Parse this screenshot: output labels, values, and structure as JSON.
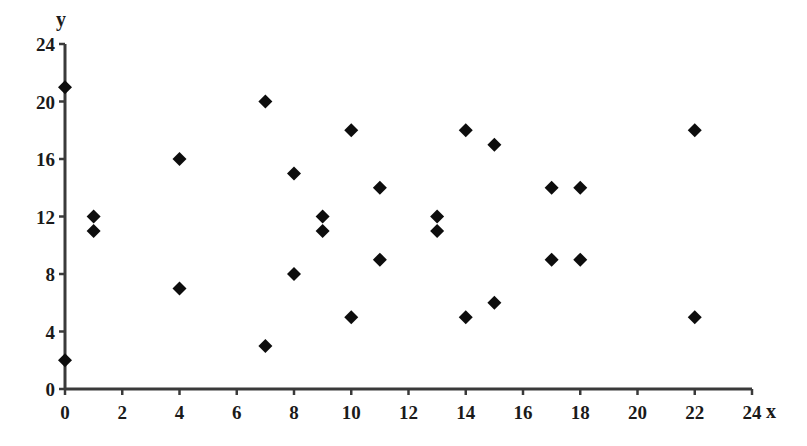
{
  "chart_data": {
    "type": "scatter",
    "title": "",
    "xlabel": "x",
    "ylabel": "y",
    "xlim": [
      0,
      24
    ],
    "ylim": [
      0,
      24
    ],
    "x_ticks": [
      0,
      2,
      4,
      6,
      8,
      10,
      12,
      14,
      16,
      18,
      20,
      22,
      24
    ],
    "y_ticks": [
      0,
      4,
      8,
      12,
      16,
      20,
      24
    ],
    "grid": false,
    "legend": null,
    "marker": "diamond",
    "marker_color": "#0d0d0d",
    "series": [
      {
        "name": "points",
        "points": [
          {
            "x": 0,
            "y": 21
          },
          {
            "x": 0,
            "y": 2
          },
          {
            "x": 1,
            "y": 12
          },
          {
            "x": 1,
            "y": 11
          },
          {
            "x": 4,
            "y": 16
          },
          {
            "x": 4,
            "y": 7
          },
          {
            "x": 7,
            "y": 20
          },
          {
            "x": 7,
            "y": 3
          },
          {
            "x": 8,
            "y": 15
          },
          {
            "x": 8,
            "y": 8
          },
          {
            "x": 9,
            "y": 12
          },
          {
            "x": 9,
            "y": 11
          },
          {
            "x": 10,
            "y": 18
          },
          {
            "x": 10,
            "y": 5
          },
          {
            "x": 11,
            "y": 14
          },
          {
            "x": 11,
            "y": 9
          },
          {
            "x": 13,
            "y": 12
          },
          {
            "x": 13,
            "y": 11
          },
          {
            "x": 14,
            "y": 18
          },
          {
            "x": 14,
            "y": 5
          },
          {
            "x": 15,
            "y": 17
          },
          {
            "x": 15,
            "y": 6
          },
          {
            "x": 17,
            "y": 14
          },
          {
            "x": 17,
            "y": 9
          },
          {
            "x": 18,
            "y": 14
          },
          {
            "x": 18,
            "y": 9
          },
          {
            "x": 22,
            "y": 18
          },
          {
            "x": 22,
            "y": 5
          }
        ]
      }
    ]
  }
}
